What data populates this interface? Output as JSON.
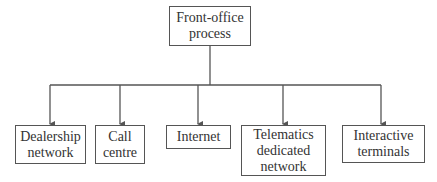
{
  "root": {
    "label": "Front-office\nprocess"
  },
  "children": [
    {
      "label": "Dealership\nnetwork"
    },
    {
      "label": "Call\ncentre"
    },
    {
      "label": "Internet"
    },
    {
      "label": "Telematics\ndedicated\nnetwork"
    },
    {
      "label": "Interactive\nterminals"
    }
  ],
  "colors": {
    "line": "#555555",
    "text": "#333333"
  }
}
